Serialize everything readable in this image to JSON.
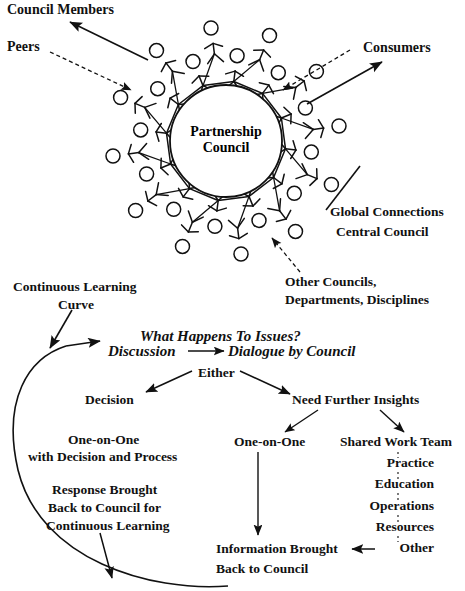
{
  "diagram": {
    "title_center": {
      "line1": "Partnership",
      "line2": "Council"
    },
    "callouts": {
      "council_members": "Council Members",
      "peers": "Peers",
      "consumers": "Consumers",
      "global_connections": "Global Connections",
      "central_council": "Central Council",
      "other_councils": "Other Councils,",
      "departments_disciplines": "Departments, Disciplines",
      "continuous_learning": "Continuous Learning",
      "curve": "Curve"
    },
    "flow": {
      "heading": "What Happens To Issues?",
      "discussion": "Discussion",
      "dialogue": "Dialogue by Council",
      "either": "Either",
      "decision": "Decision",
      "need_further_insights": "Need Further Insights",
      "one_on_one_left_l1": "One-on-One",
      "one_on_one_left_l2": "with Decision and Process",
      "response_l1": "Response Brought",
      "response_l2": "Back to Council for",
      "response_l3": "Continuous Learning",
      "one_on_one_right": "One-on-One",
      "shared_work_team": "Shared Work Team",
      "info_l1": "Information Brought",
      "info_l2": "Back to Council"
    },
    "work_team_items": [
      "Practice",
      "Education",
      "Operations",
      "Resources",
      "Other"
    ],
    "colors": {
      "ink": "#111111",
      "background": "#ffffff"
    },
    "figure_count_inner": 12,
    "figure_count_outer": 12
  }
}
